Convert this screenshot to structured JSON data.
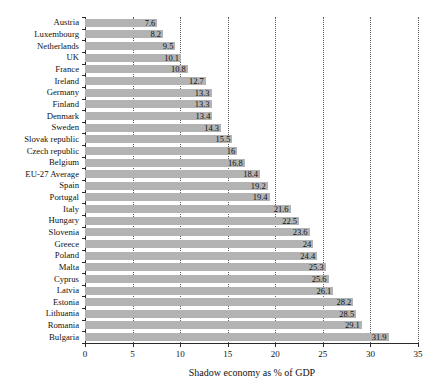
{
  "chart_data": {
    "type": "bar",
    "orientation": "horizontal",
    "title": "",
    "subtitle": "",
    "xlabel": "Shadow economy as % of GDP",
    "ylabel": "",
    "xlim": [
      0,
      35
    ],
    "xticks": [
      0,
      5,
      10,
      15,
      20,
      25,
      30,
      35
    ],
    "grid": "vertical-dotted",
    "legend": "none",
    "bar_color": "#b3b3b3",
    "axis_color": "#2b2b2b",
    "value_labels": true,
    "categories": [
      "Austria",
      "Luxembourg",
      "Netherlands",
      "UK",
      "France",
      "Ireland",
      "Germany",
      "Finland",
      "Denmark",
      "Sweden",
      "Slovak republic",
      "Czech republic",
      "Belgium",
      "EU-27 Average",
      "Spain",
      "Portugal",
      "Italy",
      "Hungary",
      "Slovenia",
      "Greece",
      "Poland",
      "Malta",
      "Cyprus",
      "Latvia",
      "Estonia",
      "Lithuania",
      "Romania",
      "Bulgaria"
    ],
    "values": [
      7.6,
      8.2,
      9.5,
      10.1,
      10.8,
      12.7,
      13.3,
      13.3,
      13.4,
      14.3,
      15.5,
      16,
      16.8,
      18.4,
      19.2,
      19.4,
      21.6,
      22.5,
      23.6,
      24,
      24.4,
      25.3,
      25.6,
      26.1,
      28.2,
      28.5,
      29.1,
      31.9
    ],
    "value_label_texts": [
      "7.6",
      "8.2",
      "9.5",
      "10.1",
      "10.8",
      "12.7",
      "13.3",
      "13.3",
      "13.4",
      "14.3",
      "15.5",
      "16",
      "16.8",
      "18.4",
      "19.2",
      "19.4",
      "21.6",
      "22.5",
      "23.6",
      "24",
      "24.4",
      "25.3",
      "25.6",
      "26.1",
      "28.2",
      "28.5",
      "29.1",
      "31.9"
    ],
    "xtick_labels": [
      "0",
      "5",
      "10",
      "15",
      "20",
      "25",
      "30",
      "35"
    ]
  }
}
